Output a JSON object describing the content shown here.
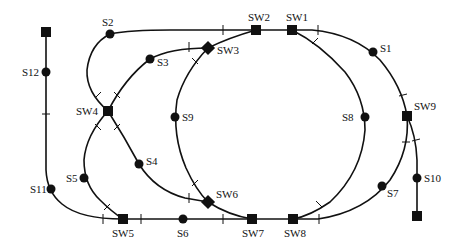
{
  "diagram": {
    "type": "railway-track-layout",
    "colors": {
      "ink": "#111111",
      "background": "#ffffff"
    },
    "signals": [
      {
        "id": "S1",
        "label": "S1",
        "x": 373,
        "y": 52
      },
      {
        "id": "S2",
        "label": "S2",
        "x": 110,
        "y": 34
      },
      {
        "id": "S3",
        "label": "S3",
        "x": 150,
        "y": 59
      },
      {
        "id": "S4",
        "label": "S4",
        "x": 139,
        "y": 164
      },
      {
        "id": "S5",
        "label": "S5",
        "x": 84,
        "y": 178
      },
      {
        "id": "S6",
        "label": "S6",
        "x": 183,
        "y": 219
      },
      {
        "id": "S7",
        "label": "S7",
        "x": 382,
        "y": 186
      },
      {
        "id": "S8",
        "label": "S8",
        "x": 365,
        "y": 117
      },
      {
        "id": "S9",
        "label": "S9",
        "x": 175,
        "y": 117
      },
      {
        "id": "S10",
        "label": "S10",
        "x": 417,
        "y": 178
      },
      {
        "id": "S11",
        "label": "S11",
        "x": 51,
        "y": 189
      },
      {
        "id": "S12",
        "label": "S12",
        "x": 46,
        "y": 72
      }
    ],
    "switches": [
      {
        "id": "SW1",
        "label": "SW1",
        "x": 292,
        "y": 30
      },
      {
        "id": "SW2",
        "label": "SW2",
        "x": 256,
        "y": 30
      },
      {
        "id": "SW3",
        "label": "SW3",
        "x": 208,
        "y": 48,
        "rotated": true
      },
      {
        "id": "SW4",
        "label": "SW4",
        "x": 108,
        "y": 111
      },
      {
        "id": "SW5",
        "label": "SW5",
        "x": 123,
        "y": 219
      },
      {
        "id": "SW6",
        "label": "SW6",
        "x": 208,
        "y": 202,
        "rotated": true
      },
      {
        "id": "SW7",
        "label": "SW7",
        "x": 252,
        "y": 219
      },
      {
        "id": "SW8",
        "label": "SW8",
        "x": 293,
        "y": 219
      },
      {
        "id": "SW9",
        "label": "SW9",
        "x": 407,
        "y": 116
      }
    ],
    "terminals": [
      {
        "id": "T-top-left",
        "x": 46,
        "y": 32
      },
      {
        "id": "T-bottom-right",
        "x": 417,
        "y": 216
      }
    ]
  }
}
